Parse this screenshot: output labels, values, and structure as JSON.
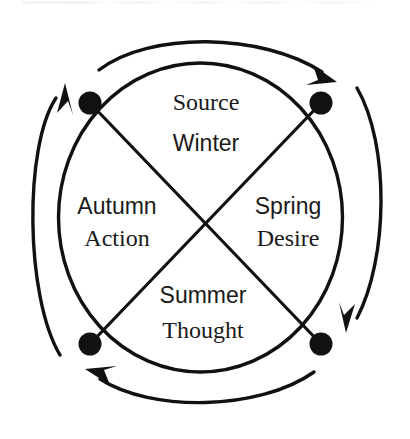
{
  "diagram": {
    "type": "cycle-wheel",
    "title": "",
    "rotation_direction": "clockwise",
    "colors": {
      "stroke": "#111111",
      "text": "#1a1a1a",
      "background": "#ffffff"
    },
    "quadrants": [
      {
        "position": "top",
        "season": "Winter",
        "concept": "Source"
      },
      {
        "position": "right",
        "season": "Spring",
        "concept": "Desire"
      },
      {
        "position": "bottom",
        "season": "Summer",
        "concept": "Thought"
      },
      {
        "position": "left",
        "season": "Autumn",
        "concept": "Action"
      }
    ],
    "nodes": [
      {
        "position": "top-left",
        "label": ""
      },
      {
        "position": "top-right",
        "label": ""
      },
      {
        "position": "bottom-right",
        "label": ""
      },
      {
        "position": "bottom-left",
        "label": ""
      }
    ],
    "arrows": [
      {
        "position": "top",
        "direction": "clockwise"
      },
      {
        "position": "right",
        "direction": "clockwise"
      },
      {
        "position": "bottom",
        "direction": "clockwise"
      },
      {
        "position": "left",
        "direction": "clockwise"
      }
    ]
  }
}
